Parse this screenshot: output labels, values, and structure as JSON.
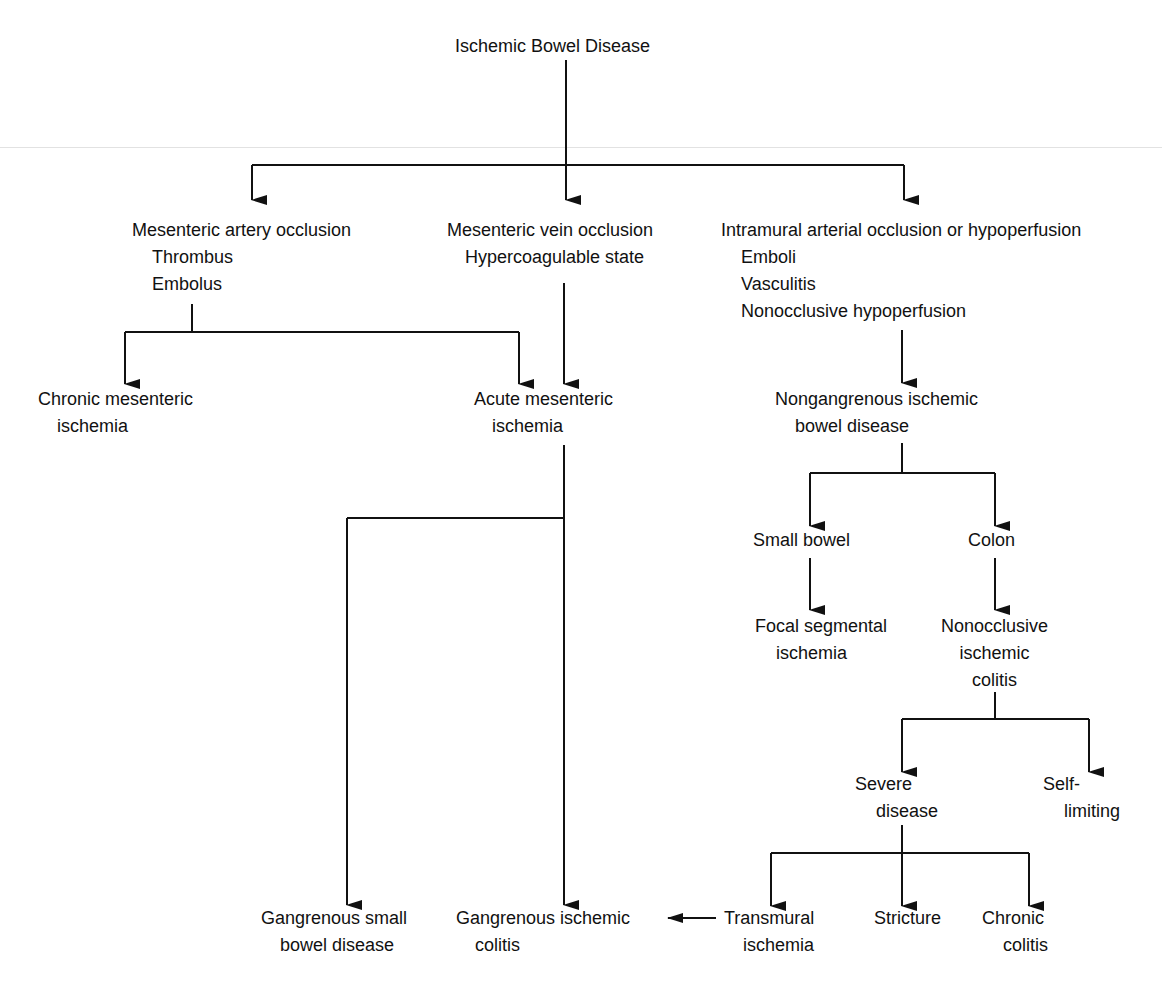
{
  "diagram": {
    "title": "Ischemic Bowel Disease",
    "nodes": {
      "root": [
        "Ischemic Bowel Disease"
      ],
      "artery": [
        "Mesenteric artery occlusion",
        "Thrombus",
        "Embolus"
      ],
      "vein": [
        "Mesenteric vein occlusion",
        "Hypercoagulable state"
      ],
      "intramural": [
        "Intramural arterial occlusion or hypoperfusion",
        "Emboli",
        "Vasculitis",
        "Nonocclusive hypoperfusion"
      ],
      "chronic_mes": [
        "Chronic mesenteric",
        "ischemia"
      ],
      "acute_mes": [
        "Acute mesenteric",
        "ischemia"
      ],
      "nongangrenous": [
        "Nongangrenous ischemic",
        "bowel disease"
      ],
      "small_bowel": [
        "Small bowel"
      ],
      "colon": [
        "Colon"
      ],
      "focal": [
        "Focal segmental",
        "ischemia"
      ],
      "nonocclusive": [
        "Nonocclusive",
        "ischemic",
        "colitis"
      ],
      "severe": [
        "Severe",
        "disease"
      ],
      "self_limiting": [
        "Self-",
        "limiting"
      ],
      "gangrenous_sb": [
        "Gangrenous small",
        "bowel disease"
      ],
      "gangrenous_col": [
        "Gangrenous ischemic",
        "colitis"
      ],
      "transmural": [
        "Transmural",
        "ischemia"
      ],
      "stricture": [
        "Stricture"
      ],
      "chronic_colitis": [
        "Chronic",
        "colitis"
      ]
    },
    "line_color": "#111111"
  }
}
